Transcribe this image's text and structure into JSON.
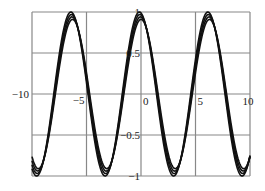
{
  "chart_data": {
    "type": "line",
    "title": "",
    "xlabel": "",
    "ylabel": "",
    "xlim": [
      -10,
      10
    ],
    "ylim": [
      -1,
      1
    ],
    "grid": true,
    "legend": null,
    "x_ticks": [
      -10,
      -5,
      0,
      5,
      10
    ],
    "x_tick_labels": [
      "-10",
      "-5",
      "0",
      "5",
      "10"
    ],
    "y_ticks": [
      -1,
      -0.5,
      0,
      0.5,
      1
    ],
    "y_tick_labels": [
      "-1",
      "-0.5",
      "0",
      "0.5",
      "1"
    ],
    "series": [
      {
        "name": "curve-1",
        "function": "a*cos(x+phi)",
        "amplitude": 1.0,
        "phase": 0.15
      },
      {
        "name": "curve-2",
        "function": "a*cos(x+phi)",
        "amplitude": 0.97,
        "phase": 0.1
      },
      {
        "name": "curve-3",
        "function": "a*cos(x+phi)",
        "amplitude": 0.94,
        "phase": 0.05
      },
      {
        "name": "curve-4",
        "function": "a*cos(x+phi)",
        "amplitude": 0.91,
        "phase": 0.0
      }
    ],
    "sample_points": {
      "x": [
        -10,
        -9.42,
        -6.28,
        -3.14,
        0,
        3.14,
        6.28,
        9.42,
        10
      ],
      "curve-1": [
        -0.89,
        -0.99,
        0.99,
        -0.99,
        0.99,
        -0.99,
        0.99,
        -0.99,
        -0.78
      ]
    },
    "colors": {
      "line": "#111111",
      "grid": "#888888",
      "frame": "#888888",
      "background": "#ffffff"
    }
  },
  "layout": {
    "plot_left": 32,
    "plot_right": 250,
    "plot_top": 12,
    "plot_bottom": 176
  }
}
